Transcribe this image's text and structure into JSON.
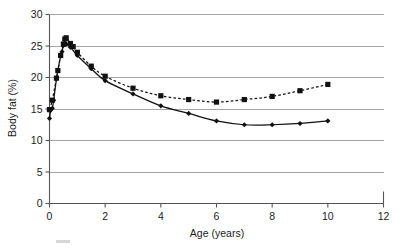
{
  "figure": {
    "name": "body-fat-vs-age-line-chart",
    "background_color": "#ffffff",
    "ink_color": "#111111",
    "grid_color": "#9a9a9a",
    "axis_color": "#555555"
  },
  "chart_data": {
    "type": "line",
    "title": "",
    "xlabel": "Age (years)",
    "ylabel": "Body fat (%)",
    "xlim": [
      0,
      12
    ],
    "ylim": [
      0,
      30
    ],
    "xticks": [
      0,
      2,
      4,
      6,
      8,
      10,
      12
    ],
    "xtick_labels": [
      "0",
      "2",
      "4",
      "6",
      "8",
      "10",
      "12"
    ],
    "yticks": [
      0,
      5,
      10,
      15,
      20,
      25,
      30
    ],
    "ytick_labels": [
      "0",
      "5",
      "10",
      "15",
      "20",
      "25",
      "30"
    ],
    "grid": "horizontal",
    "legend": "none",
    "legend_position": "none",
    "series": [
      {
        "name": "Series 1",
        "marker": "diamond",
        "linestyle": "solid",
        "color": "#111111",
        "points": [
          {
            "x": 0.0,
            "y": 13.5
          },
          {
            "x": 0.05,
            "y": 14.9
          },
          {
            "x": 0.1,
            "y": 15.1
          },
          {
            "x": 0.15,
            "y": 16.4
          },
          {
            "x": 0.25,
            "y": 19.8
          },
          {
            "x": 0.3,
            "y": 21.1
          },
          {
            "x": 0.4,
            "y": 23.4
          },
          {
            "x": 0.45,
            "y": 24.1
          },
          {
            "x": 0.5,
            "y": 25.1
          },
          {
            "x": 0.55,
            "y": 25.4
          },
          {
            "x": 0.6,
            "y": 25.3
          },
          {
            "x": 0.75,
            "y": 24.8
          },
          {
            "x": 1.0,
            "y": 23.5
          },
          {
            "x": 1.5,
            "y": 21.4
          },
          {
            "x": 2.0,
            "y": 19.5
          },
          {
            "x": 3.0,
            "y": 17.4
          },
          {
            "x": 4.0,
            "y": 15.5
          },
          {
            "x": 5.0,
            "y": 14.3
          },
          {
            "x": 6.0,
            "y": 13.1
          },
          {
            "x": 7.0,
            "y": 12.5
          },
          {
            "x": 8.0,
            "y": 12.5
          },
          {
            "x": 9.0,
            "y": 12.7
          },
          {
            "x": 10.0,
            "y": 13.1
          }
        ]
      },
      {
        "name": "Series 2",
        "marker": "square",
        "linestyle": "dashed",
        "color": "#111111",
        "points": [
          {
            "x": 0.0,
            "y": 14.9
          },
          {
            "x": 0.1,
            "y": 16.4
          },
          {
            "x": 0.25,
            "y": 19.9
          },
          {
            "x": 0.3,
            "y": 21.1
          },
          {
            "x": 0.4,
            "y": 23.5
          },
          {
            "x": 0.5,
            "y": 25.3
          },
          {
            "x": 0.55,
            "y": 26.1
          },
          {
            "x": 0.6,
            "y": 26.3
          },
          {
            "x": 0.75,
            "y": 25.4
          },
          {
            "x": 0.85,
            "y": 24.9
          },
          {
            "x": 1.0,
            "y": 24.0
          },
          {
            "x": 1.5,
            "y": 21.8
          },
          {
            "x": 2.0,
            "y": 20.2
          },
          {
            "x": 3.0,
            "y": 18.3
          },
          {
            "x": 4.0,
            "y": 17.1
          },
          {
            "x": 5.0,
            "y": 16.5
          },
          {
            "x": 6.0,
            "y": 16.1
          },
          {
            "x": 7.0,
            "y": 16.5
          },
          {
            "x": 8.0,
            "y": 17.0
          },
          {
            "x": 9.0,
            "y": 17.9
          },
          {
            "x": 10.0,
            "y": 18.9
          }
        ]
      }
    ]
  }
}
